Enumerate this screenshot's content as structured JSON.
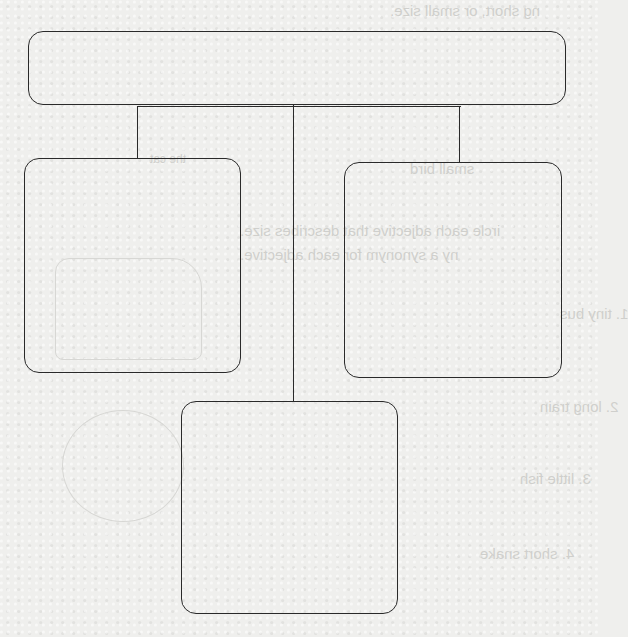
{
  "diagram": {
    "type": "tree-graphic-organizer",
    "line_color": "#2a2a2a",
    "background_color": "#efefed",
    "nodes": [
      {
        "id": "root",
        "label": "",
        "position": "top"
      },
      {
        "id": "child-left",
        "label": "",
        "position": "middle-left"
      },
      {
        "id": "child-right",
        "label": "",
        "position": "middle-right"
      },
      {
        "id": "child-bottom",
        "label": "",
        "position": "bottom-center"
      }
    ],
    "edges": [
      {
        "from": "root",
        "to": "child-left"
      },
      {
        "from": "root",
        "to": "child-bottom"
      },
      {
        "from": "root",
        "to": "child-right"
      }
    ]
  },
  "bleed_through_text": {
    "line1": "ng short, or small size.",
    "line2": "small bird",
    "line3": "the cat",
    "line4": "ircle each adjective that describes size.",
    "line5": "ny a synonym for each adjective.",
    "line6": "1. tiny bus",
    "line7": "2. long train",
    "line8": "3. little fish",
    "line9": "4. short snake"
  }
}
